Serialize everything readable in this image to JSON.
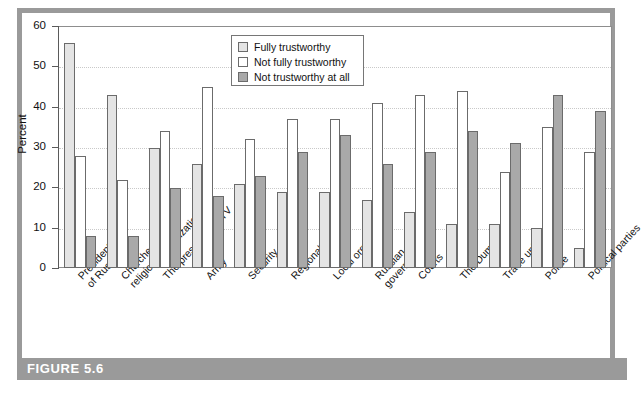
{
  "figure": {
    "caption_label": "FIGURE 5.6"
  },
  "chart_data": {
    "type": "bar",
    "title": "",
    "xlabel": "",
    "ylabel": "Percent",
    "ylim": [
      0,
      60
    ],
    "yticks": [
      0,
      10,
      20,
      30,
      40,
      50,
      60
    ],
    "grid": true,
    "legend_position": "top-center",
    "categories": [
      "President of Russia",
      "Churches, religious organizations",
      "The press, radio, TV",
      "Army",
      "Security organs",
      "Regional organs",
      "Local organs",
      "Russian government",
      "Courts",
      "The Duma",
      "Trade unions",
      "Police",
      "Political parties"
    ],
    "category_lines": [
      [
        "President",
        "of Russia"
      ],
      [
        "Churches,",
        "religious organizations"
      ],
      [
        "The press, radio, TV"
      ],
      [
        "Army"
      ],
      [
        "Security organs"
      ],
      [
        "Regional organs"
      ],
      [
        "Local organs"
      ],
      [
        "Russian",
        "government"
      ],
      [
        "Courts"
      ],
      [
        "The Duma"
      ],
      [
        "Trade unions"
      ],
      [
        "Police"
      ],
      [
        "Political parties"
      ]
    ],
    "series": [
      {
        "name": "Fully trustworthy",
        "color": "#e4e4e4",
        "values": [
          56,
          43,
          30,
          26,
          21,
          19,
          19,
          17,
          14,
          11,
          11,
          10,
          5
        ]
      },
      {
        "name": "Not fully trustworthy",
        "color": "#ffffff",
        "values": [
          28,
          22,
          34,
          45,
          32,
          37,
          37,
          41,
          43,
          44,
          24,
          35,
          29
        ]
      },
      {
        "name": "Not trustworthy at all",
        "color": "#a9a9a9",
        "values": [
          8,
          8,
          20,
          18,
          23,
          29,
          33,
          26,
          29,
          34,
          31,
          43,
          39
        ]
      }
    ]
  },
  "colors": {
    "frame": "#9a9a9a",
    "caption_bar": "#9a9a9a",
    "axis": "#5a5a5a",
    "gridline": "#c9c9c9",
    "bar_outline": "#6b6b6b"
  }
}
